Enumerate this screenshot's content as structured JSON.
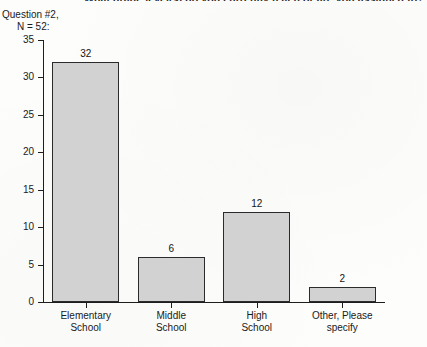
{
  "survey": {
    "title": "What grade level(s) do you currently teach or are you assigned to?",
    "question_label": "Question #2,",
    "n_label": "N = 52:"
  },
  "chart_data": {
    "type": "bar",
    "title": "What grade level(s) do you currently teach or are you assigned to?",
    "categories": [
      "Elementary School",
      "Middle School",
      "High School",
      "Other, Please specify"
    ],
    "category_lines": [
      [
        "Elementary",
        "School"
      ],
      [
        "Middle",
        "School"
      ],
      [
        "High",
        "School"
      ],
      [
        "Other, Please",
        "specify"
      ]
    ],
    "values": [
      32,
      6,
      12,
      2
    ],
    "value_labels": [
      "32",
      "6",
      "12",
      "2"
    ],
    "xlabel": "",
    "ylabel": "",
    "ylim": [
      0,
      35
    ],
    "yticks": [
      0,
      5,
      10,
      15,
      20,
      25,
      30,
      35
    ],
    "ytick_labels": [
      "0",
      "5",
      "10",
      "15",
      "20",
      "25",
      "30",
      "35"
    ],
    "grid": false,
    "legend": false,
    "n": 52,
    "bar_fill_color": "#d2d2d2",
    "bar_border_color": "#2b2b2b",
    "axis_color": "#1d1d1d"
  }
}
